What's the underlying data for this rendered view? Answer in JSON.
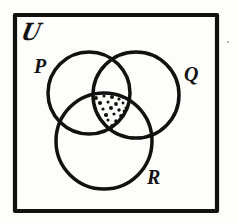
{
  "figure": {
    "style": "hand-drawn ink sketch",
    "background_color": "#fdfdfc",
    "ink_color": "#121110",
    "stipple_color": "#121110",
    "stroke_width_px": 3.4
  },
  "universe": {
    "symbol": "ℙ",
    "glyph_text": "U",
    "label_name": "universal-set-symbol",
    "frame": {
      "x": 15,
      "y": 15,
      "width": 202,
      "height": 196,
      "stroke_width_px": 4
    }
  },
  "sets": [
    {
      "id": "P",
      "label": "P",
      "position": "upper-left",
      "cx": 89,
      "cy": 93,
      "r": 41,
      "label_x": 34,
      "label_y": 56
    },
    {
      "id": "Q",
      "label": "Q",
      "position": "upper-right",
      "cx": 136,
      "cy": 95,
      "r": 43,
      "label_x": 184,
      "label_y": 64
    },
    {
      "id": "R",
      "label": "R",
      "position": "lower-center",
      "cx": 104,
      "cy": 141,
      "r": 48,
      "label_x": 147,
      "label_y": 167
    }
  ],
  "shaded_region": {
    "name": "triple-intersection",
    "expression": "P ∩ Q ∩ R",
    "fill_style": "stipple-dots",
    "dot_count": 34
  },
  "artifacts": {
    "speck": {
      "x": 227,
      "y": 41,
      "color": "#9a9a96"
    }
  }
}
